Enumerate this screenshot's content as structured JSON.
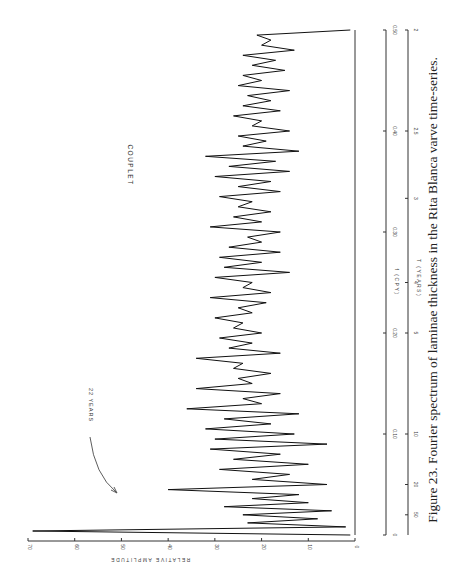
{
  "caption": "Figure 23. Fourier spectrum of laminae thickness in the Rita Blanca varve time-series.",
  "series_label": "COUPLET",
  "annotation": "22 YEARS",
  "amplitude_axis": {
    "title": "RELATIVE    AMPLITUDE",
    "ticks": [
      "0",
      "10",
      "20",
      "30",
      "40",
      "50",
      "60",
      "70"
    ]
  },
  "frequency_axis": {
    "title": "f (CPY)",
    "ticks": [
      "0",
      "0.10",
      "0.20",
      "0.30",
      "0.40",
      "0.50"
    ]
  },
  "period_axis": {
    "title": "T (YEARS)",
    "ticks": [
      "50",
      "20",
      "10",
      "5",
      "4",
      "3",
      "2.5",
      "2"
    ]
  },
  "chart_data": {
    "type": "line",
    "orientation": "rotated 90° counter-clockwise (frequency runs bottom-to-top, amplitude grows leftward)",
    "xlabel": "f (CPY)",
    "x2label": "T (YEARS)",
    "ylabel": "RELATIVE AMPLITUDE",
    "xlim": [
      0,
      0.5
    ],
    "ylim": [
      0,
      70
    ],
    "x_ticks": [
      0,
      0.1,
      0.2,
      0.3,
      0.4,
      0.5
    ],
    "x2_ticks": [
      50,
      20,
      10,
      5,
      4,
      3,
      2.5,
      2
    ],
    "y_ticks": [
      0,
      10,
      20,
      30,
      40,
      50,
      60,
      70
    ],
    "grid": false,
    "annotations": [
      {
        "text": "22 YEARS",
        "x": 0.045,
        "y": 40
      }
    ],
    "series": [
      {
        "name": "COUPLET",
        "x": [
          0.0,
          0.004,
          0.008,
          0.012,
          0.016,
          0.02,
          0.024,
          0.028,
          0.032,
          0.036,
          0.04,
          0.045,
          0.05,
          0.055,
          0.06,
          0.065,
          0.07,
          0.075,
          0.08,
          0.085,
          0.09,
          0.095,
          0.1,
          0.105,
          0.11,
          0.115,
          0.12,
          0.125,
          0.13,
          0.135,
          0.14,
          0.145,
          0.15,
          0.155,
          0.16,
          0.165,
          0.17,
          0.175,
          0.18,
          0.185,
          0.19,
          0.195,
          0.2,
          0.205,
          0.21,
          0.215,
          0.22,
          0.225,
          0.23,
          0.235,
          0.24,
          0.245,
          0.25,
          0.255,
          0.26,
          0.265,
          0.27,
          0.275,
          0.28,
          0.285,
          0.29,
          0.295,
          0.3,
          0.305,
          0.31,
          0.315,
          0.32,
          0.325,
          0.33,
          0.335,
          0.34,
          0.345,
          0.35,
          0.355,
          0.36,
          0.365,
          0.37,
          0.375,
          0.38,
          0.385,
          0.39,
          0.395,
          0.4,
          0.405,
          0.41,
          0.415,
          0.42,
          0.425,
          0.43,
          0.435,
          0.44,
          0.445,
          0.45,
          0.455,
          0.46,
          0.465,
          0.47,
          0.475,
          0.48,
          0.485,
          0.49,
          0.495,
          0.5
        ],
        "values": [
          1,
          69,
          2,
          23,
          8,
          24,
          5,
          28,
          10,
          22,
          12,
          40,
          6,
          22,
          14,
          29,
          10,
          26,
          16,
          31,
          6,
          30,
          13,
          32,
          18,
          28,
          12,
          36,
          20,
          24,
          16,
          34,
          22,
          25,
          18,
          26,
          24,
          34,
          16,
          27,
          22,
          29,
          20,
          26,
          24,
          30,
          22,
          25,
          19,
          31,
          18,
          24,
          22,
          30,
          14,
          28,
          20,
          29,
          16,
          27,
          20,
          23,
          16,
          31,
          20,
          26,
          18,
          25,
          22,
          29,
          16,
          25,
          18,
          30,
          14,
          27,
          17,
          32,
          12,
          24,
          19,
          25,
          14,
          22,
          20,
          26,
          16,
          24,
          18,
          23,
          14,
          25,
          20,
          24,
          15,
          22,
          17,
          24,
          13,
          20,
          18,
          21,
          1
        ]
      }
    ]
  }
}
